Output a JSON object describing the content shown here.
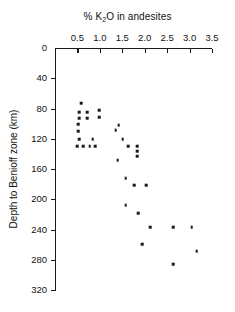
{
  "chart_data": {
    "type": "scatter",
    "title": "% K2O in andesites",
    "title_parts": {
      "pre": "% K",
      "sub": "2",
      "post": "O in andesites"
    },
    "xlabel": "% K2O in andesites",
    "ylabel": "Depth to Benioff zone (km)",
    "xlim": [
      0,
      3.5
    ],
    "ylim": [
      0,
      320
    ],
    "y_inverted": true,
    "grid": false,
    "legend": null,
    "xticks": [
      0.5,
      1.0,
      1.5,
      2.0,
      2.5,
      3.0,
      3.5
    ],
    "xtick_labels": [
      "0.5",
      "1.0",
      "1.5",
      "2.0",
      "2.5",
      "3.0",
      "3.5"
    ],
    "yticks": [
      0,
      40,
      80,
      120,
      160,
      200,
      240,
      280,
      320
    ],
    "ytick_labels": [
      "0",
      "40",
      "80",
      "120",
      "160",
      "200",
      "240",
      "280",
      "320"
    ],
    "marker": "square",
    "marker_color": "#1a1a1a",
    "x": [
      0.59,
      0.54,
      0.72,
      0.99,
      0.54,
      0.72,
      0.99,
      0.52,
      0.52,
      1.42,
      0.54,
      0.84,
      1.35,
      1.51,
      0.5,
      0.63,
      0.77,
      0.9,
      1.63,
      1.83,
      1.83,
      1.83,
      1.4,
      1.58,
      1.76,
      2.03,
      1.58,
      1.85,
      2.12,
      2.64,
      1.94,
      3.05,
      2.64,
      3.16
    ],
    "y": [
      72.8,
      84.7,
      84.7,
      82.0,
      92.6,
      92.6,
      91.3,
      100.5,
      109.8,
      101.9,
      120.4,
      120.4,
      108.5,
      120.4,
      129.6,
      129.6,
      129.6,
      129.6,
      129.6,
      129.6,
      136.2,
      142.9,
      148.1,
      172.0,
      181.2,
      181.2,
      207.7,
      218.3,
      236.8,
      236.8,
      259.3,
      236.8,
      285.7,
      268.5
    ]
  }
}
